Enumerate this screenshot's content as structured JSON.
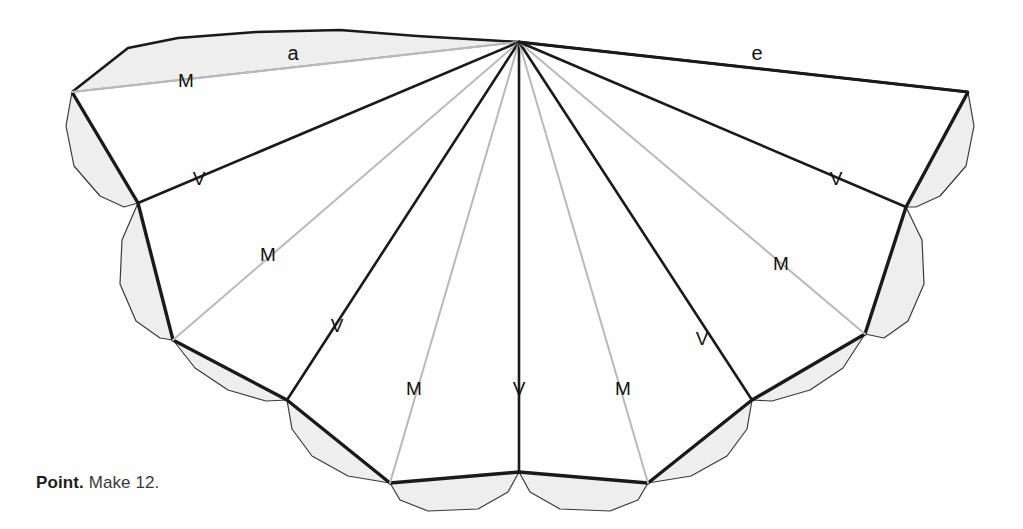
{
  "figure": {
    "title_caption": {
      "lead": "Point.",
      "body": "Make 12."
    },
    "colors": {
      "background": "#fefefe",
      "outline_dark": "#1a1a1a",
      "crease_valley": "#1a1a1a",
      "crease_mountain": "#b9b9b9",
      "flap_fill": "#eeeeee",
      "flap_stroke": "#3a3a3a",
      "label_text": "#111111"
    },
    "apex": {
      "x": 519,
      "y": 42
    },
    "bottom_vertex": {
      "x": 519,
      "y": 472
    },
    "edge_labels": [
      {
        "name": "edge-label-a",
        "text": "a",
        "x": 293,
        "y": 55
      },
      {
        "name": "edge-label-e",
        "text": "e",
        "x": 757,
        "y": 55
      }
    ],
    "crease_labels": [
      {
        "name": "crease-label-m-1",
        "text": "M",
        "x": 186,
        "y": 82
      },
      {
        "name": "crease-label-v-1",
        "text": "V",
        "x": 199,
        "y": 180
      },
      {
        "name": "crease-label-m-2",
        "text": "M",
        "x": 268,
        "y": 256
      },
      {
        "name": "crease-label-v-2",
        "text": "V",
        "x": 337,
        "y": 327
      },
      {
        "name": "crease-label-m-3",
        "text": "M",
        "x": 414,
        "y": 390
      },
      {
        "name": "crease-label-v-center",
        "text": "V",
        "x": 519,
        "y": 390
      },
      {
        "name": "crease-label-m-4",
        "text": "M",
        "x": 623,
        "y": 390
      },
      {
        "name": "crease-label-v-3",
        "text": "V",
        "x": 702,
        "y": 340
      },
      {
        "name": "crease-label-m-5",
        "text": "M",
        "x": 781,
        "y": 265
      },
      {
        "name": "crease-label-v-4",
        "text": "V",
        "x": 836,
        "y": 180
      }
    ],
    "outer_vertices": [
      {
        "name": "tip-left",
        "x": 72,
        "y": 92
      },
      {
        "name": "vertex-left-1",
        "x": 138,
        "y": 203
      },
      {
        "name": "vertex-left-2",
        "x": 173,
        "y": 340
      },
      {
        "name": "vertex-left-3",
        "x": 287,
        "y": 400
      },
      {
        "name": "vertex-left-4",
        "x": 390,
        "y": 483
      },
      {
        "name": "vertex-bottom",
        "x": 519,
        "y": 472
      },
      {
        "name": "vertex-right-4",
        "x": 648,
        "y": 483
      },
      {
        "name": "vertex-right-3",
        "x": 752,
        "y": 400
      },
      {
        "name": "vertex-right-2",
        "x": 865,
        "y": 334
      },
      {
        "name": "vertex-right-1",
        "x": 906,
        "y": 207
      },
      {
        "name": "tip-right",
        "x": 968,
        "y": 92
      }
    ],
    "creases": [
      {
        "name": "crease-left-edge-a",
        "type": "mountain",
        "to_x": 72,
        "to_y": 92
      },
      {
        "name": "crease-m-1",
        "type": "mountain",
        "to_x": 72,
        "to_y": 92
      },
      {
        "name": "crease-v-1",
        "type": "valley",
        "to_x": 138,
        "to_y": 203
      },
      {
        "name": "crease-m-2",
        "type": "mountain",
        "to_x": 173,
        "to_y": 340
      },
      {
        "name": "crease-v-2",
        "type": "valley",
        "to_x": 287,
        "to_y": 400
      },
      {
        "name": "crease-m-3",
        "type": "mountain",
        "to_x": 390,
        "to_y": 483
      },
      {
        "name": "crease-v-center",
        "type": "valley",
        "to_x": 519,
        "to_y": 472
      },
      {
        "name": "crease-m-4",
        "type": "mountain",
        "to_x": 648,
        "to_y": 483
      },
      {
        "name": "crease-v-3",
        "type": "valley",
        "to_x": 752,
        "to_y": 400
      },
      {
        "name": "crease-m-5",
        "type": "mountain",
        "to_x": 865,
        "to_y": 334
      },
      {
        "name": "crease-v-4",
        "type": "valley",
        "to_x": 906,
        "to_y": 207
      },
      {
        "name": "crease-right-edge-e",
        "type": "valley",
        "to_x": 968,
        "to_y": 92
      }
    ],
    "flaps": [
      {
        "name": "flap-top-left",
        "points": "72,92 128,48 178,38 256,32 340,30 417,36 519,42"
      },
      {
        "name": "flap-left-1",
        "points": "72,92 66,126 74,166 100,196 124,207 138,203"
      },
      {
        "name": "flap-left-2",
        "points": "138,203 122,240 120,284 136,321 160,338 173,340"
      },
      {
        "name": "flap-left-3",
        "points": "173,340 195,368 228,390 266,401 287,400"
      },
      {
        "name": "flap-left-4",
        "points": "287,400 292,429 312,456 348,476 390,483"
      },
      {
        "name": "flap-left-5",
        "points": "390,483 400,500 428,511 478,509 508,492 519,472"
      },
      {
        "name": "flap-right-5",
        "points": "648,483 638,500 610,511 560,509 530,492 519,472"
      },
      {
        "name": "flap-right-4",
        "points": "752,400 747,429 727,456 691,476 648,483"
      },
      {
        "name": "flap-right-3",
        "points": "865,334 843,368 810,390 772,401 752,400"
      },
      {
        "name": "flap-right-2",
        "points": "906,207 922,240 924,284 908,321 884,338 865,334"
      },
      {
        "name": "flap-right-1",
        "points": "968,92 974,126 966,166 940,196 916,207 906,207"
      }
    ],
    "outline_top_left": "519,42 417,36 340,30 256,32 178,38 128,48 72,92",
    "outline_top_right": "519,42 968,92"
  }
}
